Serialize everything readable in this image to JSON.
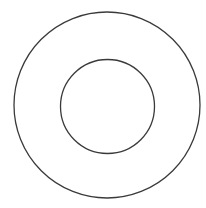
{
  "diagram": {
    "type": "concentric-circles",
    "background": "#ffffff",
    "stroke_color": "#3a3a3a",
    "stroke_width": 1.3,
    "shapes": [
      {
        "name": "outer-circle",
        "cx": 107,
        "cy": 105,
        "r": 93
      },
      {
        "name": "inner-circle",
        "cx": 107.5,
        "cy": 106.5,
        "r": 47
      }
    ]
  }
}
